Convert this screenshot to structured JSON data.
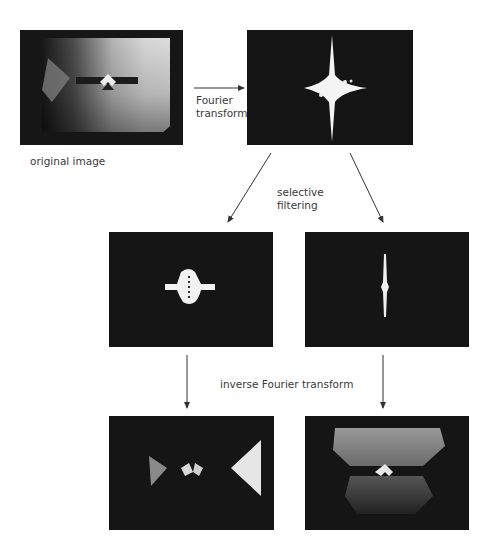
{
  "diagram": {
    "panels": {
      "original": {
        "caption": "original image"
      },
      "spectrum": {
        "caption": ""
      },
      "filtered_horizontal": {
        "caption": ""
      },
      "filtered_vertical": {
        "caption": ""
      },
      "reconstructed_horizontal": {
        "caption": ""
      },
      "reconstructed_vertical": {
        "caption": ""
      }
    },
    "labels": {
      "fourier_line1": "Fourier",
      "fourier_line2": "transform",
      "selective_line1": "selective",
      "selective_line2": "filtering",
      "inverse": "inverse Fourier transform",
      "original": "original image"
    },
    "colors": {
      "panel_bg": "#151515",
      "highlight": "#f2f2f2",
      "arrow": "#333333",
      "text": "#3a3a3a"
    }
  }
}
